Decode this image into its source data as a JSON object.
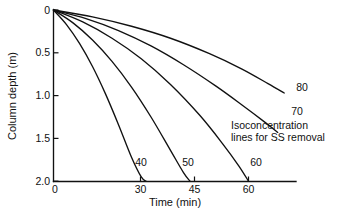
{
  "figure": {
    "background_color": "#ffffff",
    "ink_color": "#111111",
    "caption_fragment": ""
  },
  "chart_data": {
    "type": "line",
    "title": "",
    "xlabel": "Time (min)",
    "ylabel": "Column depth (m)",
    "xlim": [
      0,
      72
    ],
    "ylim": [
      0,
      2.0
    ],
    "y_inverted": true,
    "grid": false,
    "legend_position": "inline-curve-labels",
    "x_ticks": [
      0,
      30,
      45,
      60
    ],
    "x_tick_labels": [
      "0",
      "30",
      "45",
      "60"
    ],
    "y_ticks": [
      0,
      0.5,
      1.0,
      1.5,
      2.0
    ],
    "y_tick_labels": [
      "0",
      "0.5",
      "1.0",
      "1.5",
      "2.0"
    ],
    "annotations": [
      {
        "name": "isoconcentration-note",
        "line1": "Isoconcentration",
        "line2": "lines for SS removal"
      }
    ],
    "series": [
      {
        "name": "40",
        "label": "40",
        "label_value": "40 percent SS removal",
        "x": [
          0,
          4,
          8,
          12,
          16,
          20,
          24,
          27,
          28.5
        ],
        "y": [
          0,
          0.17,
          0.39,
          0.66,
          0.98,
          1.34,
          1.72,
          1.95,
          2.0
        ]
      },
      {
        "name": "50",
        "label": "50",
        "label_value": "50 percent SS removal",
        "x": [
          0,
          6,
          12,
          18,
          24,
          30,
          36,
          40,
          42
        ],
        "y": [
          0,
          0.15,
          0.35,
          0.6,
          0.9,
          1.25,
          1.64,
          1.9,
          2.0
        ]
      },
      {
        "name": "60",
        "label": "60",
        "label_value": "60 percent SS removal",
        "x": [
          0,
          9,
          18,
          27,
          36,
          45,
          52,
          57,
          60
        ],
        "y": [
          0,
          0.14,
          0.33,
          0.57,
          0.87,
          1.23,
          1.56,
          1.82,
          2.0
        ]
      },
      {
        "name": "70",
        "label": "70",
        "label_value": "70 percent SS removal",
        "x": [
          0,
          10,
          20,
          30,
          40,
          50,
          58,
          65,
          69
        ],
        "y": [
          0,
          0.1,
          0.24,
          0.42,
          0.64,
          0.89,
          1.11,
          1.31,
          1.43
        ]
      },
      {
        "name": "80",
        "label": "80",
        "label_value": "80 percent SS removal",
        "x": [
          0,
          12,
          24,
          36,
          48,
          58,
          66,
          71
        ],
        "y": [
          0,
          0.08,
          0.19,
          0.33,
          0.51,
          0.69,
          0.86,
          0.97
        ]
      }
    ],
    "curve_labels": [
      {
        "name": "40",
        "text": "40",
        "x_px": 141,
        "y_px": 162
      },
      {
        "name": "50",
        "text": "50",
        "x_px": 188,
        "y_px": 162
      },
      {
        "name": "60",
        "text": "60",
        "x_px": 256,
        "y_px": 162
      },
      {
        "name": "70",
        "text": "70",
        "x_px": 297,
        "y_px": 112
      },
      {
        "name": "80",
        "text": "80",
        "x_px": 302,
        "y_px": 88
      }
    ]
  }
}
